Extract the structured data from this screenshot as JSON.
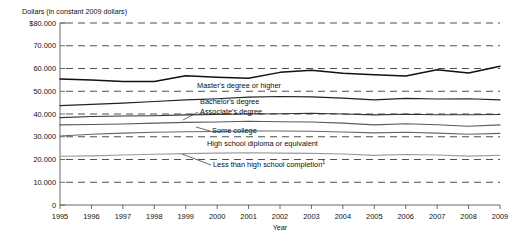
{
  "chart_data": {
    "type": "line",
    "title": "",
    "ylabel": "Dollars (in constant 2009 dollars)",
    "xlabel": "Year",
    "x": [
      1995,
      1996,
      1997,
      1998,
      1999,
      2000,
      2001,
      2002,
      2003,
      2004,
      2005,
      2006,
      2007,
      2008,
      2009
    ],
    "xtick_labels": [
      "1995",
      "1996",
      "1997",
      "1998",
      "1999",
      "2000",
      "2001",
      "2002",
      "2003",
      "2004",
      "2005",
      "2006",
      "2007",
      "2008",
      "2009"
    ],
    "ytick_labels": [
      "$80.000",
      "70.000",
      "60.000",
      "50.000",
      "40.000",
      "30.000",
      "20.000",
      "10.000",
      "0"
    ],
    "ytick_values": [
      80000,
      70000,
      60000,
      50000,
      40000,
      30000,
      20000,
      10000,
      0
    ],
    "ylim": [
      0,
      80000
    ],
    "xlim": [
      1995,
      2009
    ],
    "grid": true,
    "grid_style": "dashed-horizontal",
    "legend_position": "inline-labels",
    "series": [
      {
        "name": "Master's degree or higher",
        "label": "Master's degree or higher",
        "color": "#111111",
        "width": 1.5,
        "values": [
          55400,
          55000,
          54300,
          54300,
          56800,
          56200,
          55700,
          58300,
          59200,
          57900,
          57200,
          56700,
          59500,
          58000,
          61000
        ]
      },
      {
        "name": "Bachelor's degree",
        "label": "Bachelor's degree",
        "color": "#222222",
        "width": 1.2,
        "values": [
          43700,
          44200,
          44800,
          45500,
          46200,
          46700,
          47400,
          47700,
          47500,
          47000,
          46200,
          46900,
          46600,
          46700,
          46200
        ]
      },
      {
        "name": "Associate's degree",
        "label": "Associate's degree",
        "color": "#333333",
        "width": 1.1,
        "values": [
          38400,
          38900,
          39100,
          39200,
          39600,
          39800,
          40000,
          40100,
          40300,
          40000,
          39600,
          39900,
          39700,
          39700,
          39800
        ]
      },
      {
        "name": "Some college",
        "label": "Some college",
        "color": "#5a5a5a",
        "width": 1.1,
        "values": [
          35200,
          35400,
          35600,
          36000,
          36300,
          36500,
          36800,
          36600,
          36500,
          36000,
          35200,
          35700,
          35300,
          34600,
          35200
        ]
      },
      {
        "name": "High school diploma or equivalent",
        "label": "High school diploma or equivalent",
        "color": "#666666",
        "width": 1.1,
        "values": [
          30300,
          31100,
          31600,
          32000,
          32200,
          32300,
          32500,
          32500,
          32400,
          32100,
          31700,
          32000,
          31600,
          31100,
          31500
        ]
      },
      {
        "name": "Less than high school completion",
        "label": "Less than high school completion",
        "label_superscript": "1",
        "color": "#9a9a9a",
        "width": 1.1,
        "values": [
          21400,
          21600,
          22000,
          22300,
          22600,
          22800,
          23000,
          22800,
          22700,
          22400,
          21800,
          22200,
          22000,
          21500,
          21900
        ]
      }
    ],
    "inline_labels": [
      {
        "text": "Master's degree or higher",
        "x": 197,
        "y": 88,
        "leader": false
      },
      {
        "text": "Bachelor's degree",
        "x": 200,
        "y": 104,
        "leader": false
      },
      {
        "text": "Associate's degree",
        "x": 200,
        "y": 114,
        "leader": true,
        "lx1": 198,
        "ly1": 112,
        "lx2": 183,
        "ly2": 120
      },
      {
        "text": "Some college",
        "x": 212,
        "y": 133,
        "leader": true,
        "lx1": 210,
        "ly1": 131,
        "lx2": 196,
        "ly2": 127
      },
      {
        "text": "High school diploma or equivalent",
        "x": 207,
        "y": 146,
        "leader": false
      },
      {
        "text": "Less than high school completion",
        "x": 213,
        "y": 167,
        "leader": true,
        "lx1": 211,
        "ly1": 165,
        "lx2": 182,
        "ly2": 154
      }
    ]
  }
}
